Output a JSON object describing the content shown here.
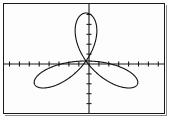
{
  "figure": {
    "kind": "graphing-calculator-screen",
    "title": "",
    "background_color": "#fdfdfd",
    "frame_color": "#1a1a1a",
    "curve_color": "#111111",
    "axis_color": "#1a1a1a"
  },
  "chart_data": {
    "type": "line",
    "plot_kind": "polar-rose",
    "title": "",
    "xlabel": "",
    "ylabel": "",
    "grid": false,
    "legend": null,
    "axes": {
      "x_axis_visible": true,
      "y_axis_visible": true,
      "origin_px": [
        86,
        61
      ],
      "xlim": [
        -8.3,
        7.6
      ],
      "ylim": [
        -5.6,
        5.5
      ],
      "x_tick_step": 1,
      "y_tick_step": 1,
      "x_tick_labels": [],
      "y_tick_labels": [],
      "tick_mark_length_px": 4
    },
    "equation": "r = 5 sin(3θ)",
    "petal_count": 3,
    "petal_max_radius": 5,
    "petal_axis_angles_deg": [
      150,
      30,
      270
    ],
    "petal_tips_data_coords": [
      [
        -4.33,
        2.5
      ],
      [
        4.33,
        2.5
      ],
      [
        0,
        -5
      ]
    ],
    "petal_tips_px": [
      [
        36,
        38
      ],
      [
        137,
        37
      ],
      [
        86,
        111
      ]
    ],
    "series": [
      {
        "name": "r = 5 sin(3θ)",
        "theta_deg": [
          0,
          15,
          30,
          45,
          60,
          75,
          90,
          105,
          120,
          135,
          150,
          165,
          180,
          195,
          210,
          225,
          240,
          255,
          270,
          285,
          300,
          315,
          330,
          345,
          360
        ],
        "r": [
          0,
          3.54,
          5,
          3.54,
          0,
          -3.54,
          -5,
          -3.54,
          0,
          3.54,
          5,
          3.54,
          0,
          -3.54,
          -5,
          -3.54,
          0,
          3.54,
          5,
          3.54,
          0,
          -3.54,
          -5,
          -3.54,
          0
        ]
      }
    ]
  }
}
